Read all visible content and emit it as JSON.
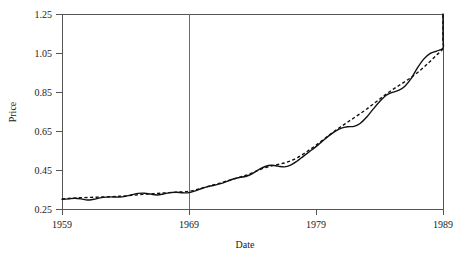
{
  "chart_data": {
    "type": "line",
    "title": "",
    "xlabel": "Date",
    "ylabel": "Price",
    "xlim": [
      1959,
      1989
    ],
    "ylim": [
      0.25,
      1.25
    ],
    "grid": false,
    "legend": "none",
    "x_ticks": [
      "1959",
      "1969",
      "1979",
      "1989"
    ],
    "x_tick_values": [
      1959,
      1969,
      1979,
      1989
    ],
    "y_ticks": [
      "0.25",
      "0.45",
      "0.65",
      "0.85",
      "1.05",
      "1.25"
    ],
    "y_tick_values": [
      0.25,
      0.45,
      0.65,
      0.85,
      1.05,
      1.25
    ],
    "annotations": [
      {
        "name": "vertical-reference-line",
        "x": 1969,
        "style": "solid"
      }
    ],
    "x": [
      1959.0,
      1959.5,
      1960.0,
      1960.5,
      1961.0,
      1961.5,
      1962.0,
      1962.5,
      1963.0,
      1963.5,
      1964.0,
      1964.5,
      1965.0,
      1965.5,
      1966.0,
      1966.5,
      1967.0,
      1967.5,
      1968.0,
      1968.5,
      1969.0,
      1969.5,
      1970.0,
      1970.5,
      1971.0,
      1971.5,
      1972.0,
      1972.5,
      1973.0,
      1973.5,
      1974.0,
      1974.5,
      1975.0,
      1975.5,
      1976.0,
      1976.5,
      1977.0,
      1977.5,
      1978.0,
      1978.5,
      1979.0,
      1979.5,
      1980.0,
      1980.5,
      1981.0,
      1981.5,
      1982.0,
      1982.5,
      1983.0,
      1983.5,
      1984.0,
      1984.5,
      1985.0,
      1985.5,
      1986.0,
      1986.5,
      1987.0,
      1987.5,
      1988.0,
      1988.5,
      1989.0
    ],
    "series": [
      {
        "name": "Price",
        "style": "solid",
        "values": [
          0.3,
          0.302,
          0.305,
          0.302,
          0.296,
          0.3,
          0.307,
          0.311,
          0.312,
          0.311,
          0.315,
          0.323,
          0.33,
          0.331,
          0.326,
          0.322,
          0.327,
          0.334,
          0.336,
          0.333,
          0.334,
          0.343,
          0.355,
          0.365,
          0.372,
          0.38,
          0.392,
          0.404,
          0.412,
          0.418,
          0.432,
          0.452,
          0.468,
          0.474,
          0.47,
          0.466,
          0.475,
          0.495,
          0.52,
          0.545,
          0.57,
          0.598,
          0.625,
          0.648,
          0.665,
          0.672,
          0.674,
          0.69,
          0.722,
          0.762,
          0.8,
          0.832,
          0.848,
          0.858,
          0.88,
          0.92,
          0.975,
          1.02,
          1.048,
          1.06,
          1.075
        ]
      },
      {
        "name": "Trend",
        "style": "dashed",
        "values": [
          0.302,
          0.304,
          0.306,
          0.308,
          0.309,
          0.31,
          0.311,
          0.312,
          0.313,
          0.315,
          0.317,
          0.32,
          0.323,
          0.326,
          0.328,
          0.33,
          0.332,
          0.334,
          0.336,
          0.338,
          0.341,
          0.348,
          0.357,
          0.366,
          0.375,
          0.384,
          0.394,
          0.404,
          0.413,
          0.423,
          0.436,
          0.45,
          0.462,
          0.471,
          0.478,
          0.486,
          0.497,
          0.512,
          0.532,
          0.554,
          0.577,
          0.602,
          0.627,
          0.651,
          0.674,
          0.696,
          0.718,
          0.74,
          0.763,
          0.788,
          0.813,
          0.838,
          0.861,
          0.882,
          0.903,
          0.925,
          0.95,
          0.978,
          1.008,
          1.04,
          1.072
        ]
      }
    ],
    "solid_tail": [
      1.075,
      1.12,
      1.16,
      1.155,
      1.175,
      1.25
    ],
    "dashed_tail": [
      1.072,
      1.105,
      1.14,
      1.175,
      1.21,
      1.248
    ]
  },
  "axes": {
    "ylabel": "Price",
    "xlabel": "Date"
  }
}
